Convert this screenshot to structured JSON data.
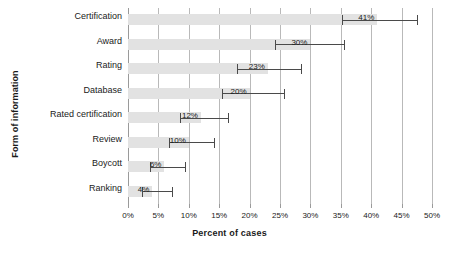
{
  "chart_data": {
    "type": "bar",
    "orientation": "horizontal",
    "title": "",
    "xlabel": "Percent of cases",
    "ylabel": "Form of information",
    "xlim": [
      0,
      50
    ],
    "xtick_step": 5,
    "xticks": [
      "0%",
      "5%",
      "10%",
      "15%",
      "20%",
      "25%",
      "30%",
      "35%",
      "40%",
      "45%",
      "50%"
    ],
    "xtick_values": [
      0,
      5,
      10,
      15,
      20,
      25,
      30,
      35,
      40,
      45,
      50
    ],
    "grid": true,
    "legend": "none",
    "categories": [
      "Certification",
      "Award",
      "Rating",
      "Database",
      "Rated certification",
      "Review",
      "Boycott",
      "Ranking"
    ],
    "values": [
      41,
      30,
      23,
      20,
      12,
      10,
      6,
      4
    ],
    "value_labels": [
      "41%",
      "30%",
      "23%",
      "20%",
      "12%",
      "10%",
      "6%",
      "4%"
    ],
    "error_low": [
      35.2,
      24.2,
      18.0,
      15.4,
      8.5,
      6.8,
      3.7,
      2.3
    ],
    "error_high": [
      47.5,
      35.6,
      28.4,
      25.6,
      16.5,
      14.1,
      9.4,
      7.3
    ],
    "colors": {
      "bar_fill": "#e2e2e2",
      "error_bar": "#4a4a4a",
      "gridline": "#b9b9b9",
      "text": "#1a1a1a"
    }
  }
}
